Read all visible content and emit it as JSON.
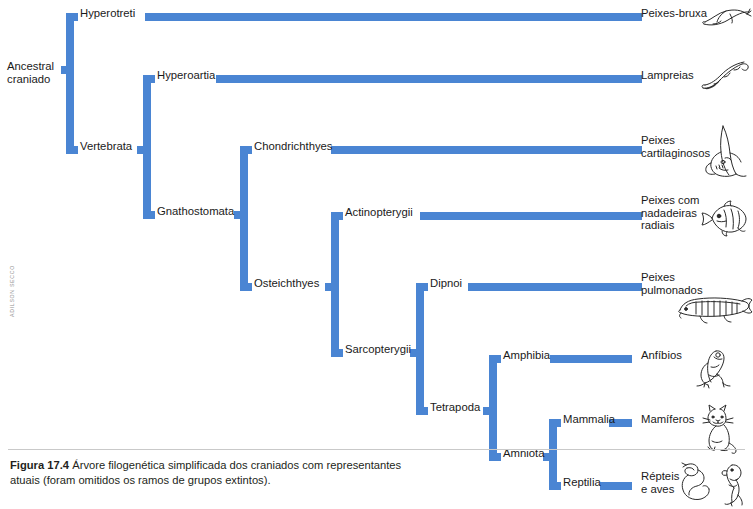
{
  "figure": {
    "number_label": "Figura 17.4",
    "caption_text": "Árvore filogenética simplificada dos craniados com representantes atuais (foram omitidos os ramos de grupos extintos).",
    "credit": "ADILSON SECCO",
    "accent_color": "#4a85d3",
    "text_color": "#1a1a1a",
    "background_color": "#ffffff"
  },
  "tree": {
    "root_label": "Ancestral craniado",
    "root_label_line1": "Ancestral",
    "root_label_line2": "craniado",
    "internal_nodes": [
      {
        "id": "hyperotreti",
        "label": "Hyperotreti"
      },
      {
        "id": "vertebrata",
        "label": "Vertebrata"
      },
      {
        "id": "hyperoartia",
        "label": "Hyperoartia"
      },
      {
        "id": "gnathostomata",
        "label": "Gnathostomata"
      },
      {
        "id": "chondrichthyes",
        "label": "Chondrichthyes"
      },
      {
        "id": "osteichthyes",
        "label": "Osteichthyes"
      },
      {
        "id": "actinopterygii",
        "label": "Actinopterygii"
      },
      {
        "id": "sarcopterygii",
        "label": "Sarcopterygii"
      },
      {
        "id": "dipnoi",
        "label": "Dipnoi"
      },
      {
        "id": "tetrapoda",
        "label": "Tetrapoda"
      },
      {
        "id": "amphibia",
        "label": "Amphibia"
      },
      {
        "id": "amniota",
        "label": "Amniota"
      },
      {
        "id": "mammalia",
        "label": "Mammalia"
      },
      {
        "id": "reptilia",
        "label": "Reptilia"
      }
    ],
    "terminals": [
      {
        "id": "peixes-bruxa",
        "label": "Peixes-bruxa",
        "line1": "Peixes-bruxa",
        "line2": "",
        "icon": "hagfish-illustration"
      },
      {
        "id": "lampreias",
        "label": "Lampreias",
        "line1": "Lampreias",
        "line2": "",
        "icon": "lamprey-illustration"
      },
      {
        "id": "peixes-cartilaginosos",
        "label": "Peixes cartilaginosos",
        "line1": "Peixes",
        "line2": "cartilaginosos",
        "icon": "shark-illustration"
      },
      {
        "id": "peixes-nadadeiras-radiais",
        "label": "Peixes com nadadeiras radiais",
        "line1": "Peixes com",
        "line2": "nadadeiras",
        "line3": "radiais",
        "icon": "ray-finned-fish-illustration"
      },
      {
        "id": "peixes-pulmonados",
        "label": "Peixes pulmonados",
        "line1": "Peixes",
        "line2": "pulmonados",
        "icon": "lungfish-illustration"
      },
      {
        "id": "anfibios",
        "label": "Anfíbios",
        "line1": "Anfíbios",
        "line2": "",
        "icon": "frog-illustration"
      },
      {
        "id": "mamiferos",
        "label": "Mamíferos",
        "line1": "Mamíferos",
        "line2": "",
        "icon": "cat-illustration"
      },
      {
        "id": "repteis-e-aves",
        "label": "Répteis e aves",
        "line1": "Répteis",
        "line2": "e aves",
        "icon": "snake-and-bird-illustration"
      }
    ]
  }
}
